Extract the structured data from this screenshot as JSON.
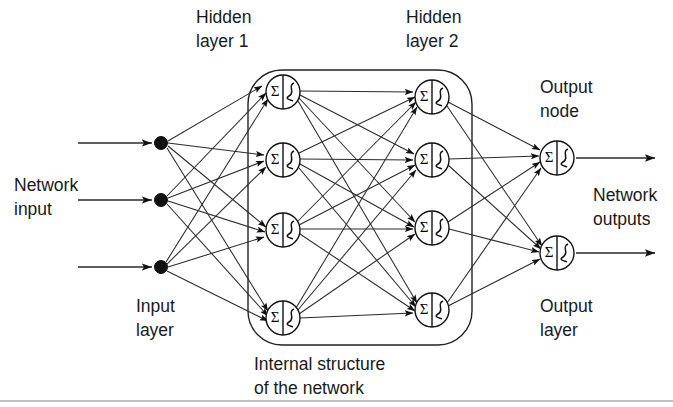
{
  "figure": {
    "background_color": "#ffffff",
    "line_color": "#2a2a2a",
    "text_color": "#1a1a1a",
    "width": 673,
    "height": 407
  },
  "labels": {
    "hidden_layer_1_line1": "Hidden",
    "hidden_layer_1_line2": "layer 1",
    "hidden_layer_2_line1": "Hidden",
    "hidden_layer_2_line2": "layer 2",
    "output_node_line1": "Output",
    "output_node_line2": "node",
    "network_input_line1": "Network",
    "network_input_line2": "input",
    "network_outputs_line1": "Network",
    "network_outputs_line2": "outputs",
    "input_layer_line1": "Input",
    "input_layer_line2": "layer",
    "output_layer_line1": "Output",
    "output_layer_line2": "layer",
    "internal_structure_line1": "Internal structure",
    "internal_structure_line2": "of the network"
  },
  "node_glyph": {
    "summation_symbol": "Σ",
    "transfer_function": "sigmoid-s-curve"
  },
  "network": {
    "input_nodes": [
      {
        "id": "in1",
        "x": 161,
        "y": 143
      },
      {
        "id": "in2",
        "x": 161,
        "y": 200
      },
      {
        "id": "in3",
        "x": 161,
        "y": 267
      }
    ],
    "hidden1_nodes": [
      {
        "id": "h1a",
        "x": 283,
        "y": 92
      },
      {
        "id": "h1b",
        "x": 283,
        "y": 160
      },
      {
        "id": "h1c",
        "x": 283,
        "y": 230
      },
      {
        "id": "h1d",
        "x": 283,
        "y": 318
      }
    ],
    "hidden2_nodes": [
      {
        "id": "h2a",
        "x": 432,
        "y": 97
      },
      {
        "id": "h2b",
        "x": 432,
        "y": 160
      },
      {
        "id": "h2c",
        "x": 432,
        "y": 228
      },
      {
        "id": "h2d",
        "x": 432,
        "y": 310
      }
    ],
    "output_nodes": [
      {
        "id": "o1",
        "x": 557,
        "y": 158
      },
      {
        "id": "o2",
        "x": 557,
        "y": 253
      }
    ],
    "node_radius": 17,
    "input_dot_radius": 6.5,
    "enclosure": {
      "x": 248,
      "y": 70,
      "width": 224,
      "height": 275,
      "corner_radius": 34
    },
    "input_line_start_x": 78,
    "output_line_end_x": 660
  }
}
